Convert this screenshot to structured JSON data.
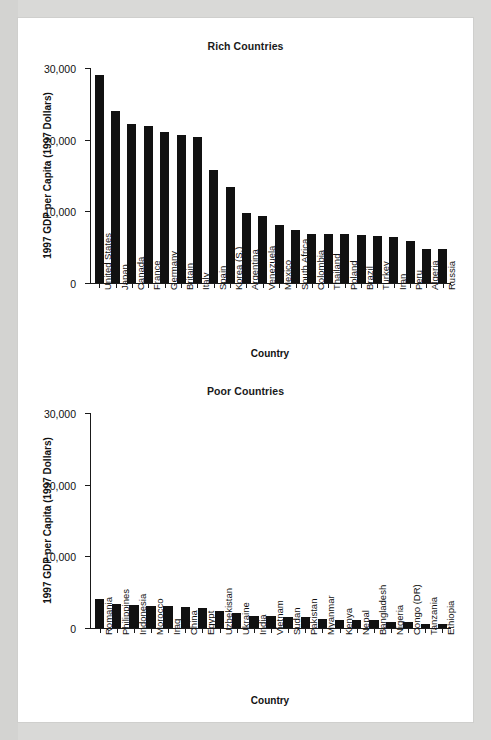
{
  "figure": {
    "background": "#d9d9d7",
    "card_background": "#ffffff",
    "bar_color": "#111111",
    "axis_color": "#1a1a1a"
  },
  "chart_data": [
    {
      "type": "bar",
      "title": "Rich Countries",
      "xlabel": "Country",
      "ylabel": "1997 GDP per Capita (1997 Dollars)",
      "ylim": [
        0,
        30000
      ],
      "yticks": [
        0,
        10000,
        20000,
        30000
      ],
      "ytick_labels": [
        "0",
        "10,000",
        "20,000",
        "30,000"
      ],
      "grid": false,
      "legend": "none",
      "categories": [
        "United States",
        "Japan",
        "Canada",
        "France",
        "Germany",
        "Britain",
        "Italy",
        "Spain",
        "Korea (S.)",
        "Argentina",
        "Venezuela",
        "Mexico",
        "South Africa",
        "Colombia",
        "Thailand",
        "Poland",
        "Brazil",
        "Turkey",
        "Iran",
        "Peru",
        "Algeria",
        "Russia"
      ],
      "values": [
        29000,
        24000,
        22200,
        21900,
        21100,
        20700,
        20400,
        15700,
        13400,
        9800,
        9300,
        8100,
        7400,
        6900,
        6800,
        6800,
        6700,
        6600,
        6400,
        5800,
        4800,
        4700
      ]
    },
    {
      "type": "bar",
      "title": "Poor Countries",
      "xlabel": "Country",
      "ylabel": "1997 GDP per Capita (1997 Dollars)",
      "ylim": [
        0,
        30000
      ],
      "yticks": [
        0,
        10000,
        20000,
        30000
      ],
      "ytick_labels": [
        "0",
        "10,000",
        "20,000",
        "30,000"
      ],
      "grid": false,
      "legend": "none",
      "categories": [
        "Romania",
        "Philippines",
        "Indonesia",
        "Morocco",
        "Iraq",
        "China",
        "Egypt",
        "Uzbekistan",
        "Ukraine",
        "India",
        "Vietnam",
        "Sudan",
        "Pakistan",
        "Myanmar",
        "Kenya",
        "Nepal",
        "Bangladesh",
        "Nigeria",
        "Congo (DR)",
        "Tanzania",
        "Ethiopia"
      ],
      "values": [
        4050,
        3300,
        3250,
        3100,
        3050,
        2900,
        2850,
        2400,
        2050,
        1700,
        1650,
        1600,
        1550,
        1200,
        1150,
        1100,
        1050,
        900,
        800,
        600,
        500
      ]
    }
  ]
}
